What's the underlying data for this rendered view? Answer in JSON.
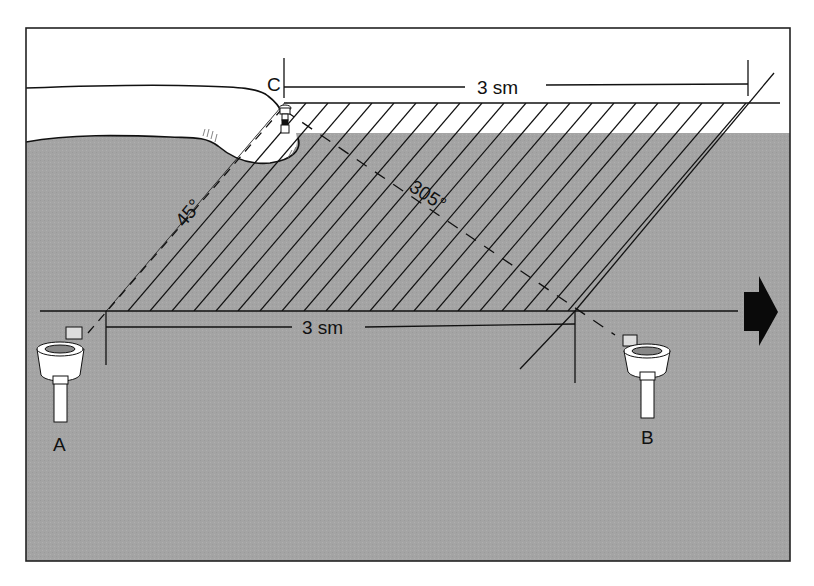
{
  "diagram": {
    "colors": {
      "water": "#a4a4a4",
      "land": "#ffffff",
      "ink": "#111111",
      "frame": "#222222"
    },
    "labels": {
      "point_a": "A",
      "point_b": "B",
      "point_c": "C",
      "top_distance": "3 sm",
      "bottom_distance": "3 sm",
      "bearing_from_a": "45°",
      "bearing_from_b": "305°"
    },
    "objects": {
      "lighthouse": "lighthouse-icon",
      "buoy_a": "compass-buoy-icon",
      "buoy_b": "compass-buoy-icon",
      "course_arrow": "arrow-right-icon"
    }
  }
}
